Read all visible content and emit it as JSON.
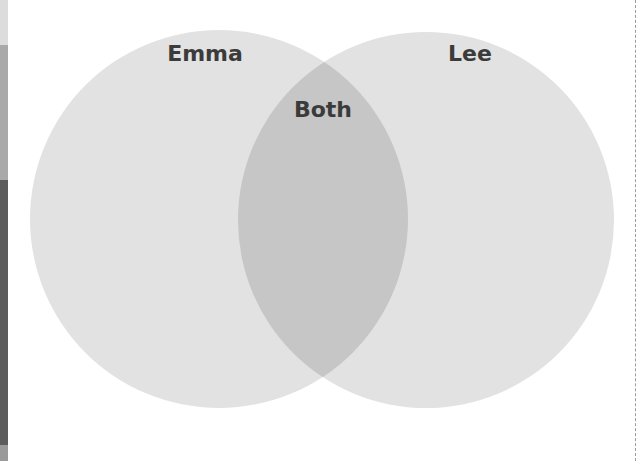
{
  "diagram": {
    "type": "venn",
    "sets": [
      {
        "label": "Emma",
        "color": "#e2e2e2"
      },
      {
        "label": "Lee",
        "color": "#e2e2e2"
      }
    ],
    "intersection": {
      "label": "Both",
      "color": "#c6c6c6"
    },
    "label_color": "#3b3b3b"
  }
}
